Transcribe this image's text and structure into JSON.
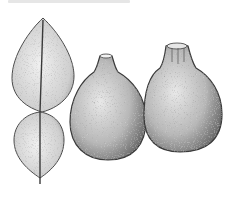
{
  "image": {
    "subject": "Botanical stipple illustration of a citrus plant: compound winged leaf and two fruits",
    "style": "black ink stipple drawing on white",
    "background_color": "#ffffff",
    "ink_color": "#3a3a3a"
  },
  "caption": {
    "text": "",
    "legible": false,
    "note": "faint cut-off caption at top edge"
  },
  "elements": {
    "leaf": {
      "label": "winged compound leaf",
      "segments": 2
    },
    "fruits": [
      {
        "label": "fruit-left",
        "shape": "pear-shaped, bumpy rind"
      },
      {
        "label": "fruit-right",
        "shape": "pear-shaped, bumpy rind"
      }
    ]
  }
}
